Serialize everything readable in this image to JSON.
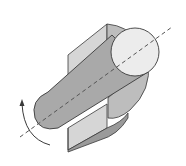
{
  "diagram": {
    "title": "Cylinder rotating about its axis through a rectangular plane section",
    "elements": [
      {
        "name": "rectangular-plane",
        "description": "Vertical rectangular plane slab"
      },
      {
        "name": "cylinder-body",
        "description": "Cylinder lying diagonally"
      },
      {
        "name": "cylinder-end-face",
        "description": "Circular end face (top right)"
      },
      {
        "name": "rotation-axis",
        "description": "Dashed diagonal axis line"
      },
      {
        "name": "rotation-arrow",
        "description": "Curved arrow indicating rotation"
      }
    ],
    "colors": {
      "plane_light": "#d6d6d6",
      "plane_dark": "#a8a8a8",
      "cylinder_body": "#a9a9a9",
      "cylinder_shadow": "#bdbdbd",
      "end_face": "#ececec",
      "stroke": "#3a3a3a",
      "axis": "#555555"
    }
  }
}
